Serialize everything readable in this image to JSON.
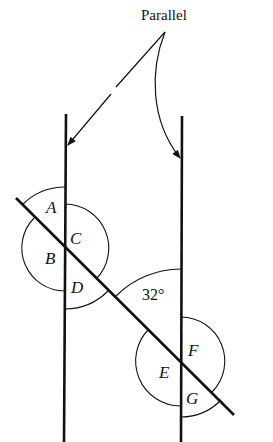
{
  "diagram": {
    "title": "Parallel",
    "annotation_label": "Parallel",
    "given_angle": "32°",
    "angle_labels": {
      "A": "A",
      "B": "B",
      "C": "C",
      "D": "D",
      "E": "E",
      "F": "F",
      "G": "G"
    },
    "lines": [
      {
        "id": "left-parallel",
        "type": "parallel"
      },
      {
        "id": "right-parallel",
        "type": "parallel"
      },
      {
        "id": "transversal",
        "type": "transversal"
      }
    ],
    "intersections": [
      {
        "id": "upper-left",
        "angles": [
          "A",
          "B",
          "C",
          "D"
        ]
      },
      {
        "id": "lower-right",
        "angles": [
          "32°",
          "E",
          "F",
          "G"
        ]
      }
    ],
    "colors": {
      "ink": "#111111",
      "background": "#ffffff"
    }
  }
}
